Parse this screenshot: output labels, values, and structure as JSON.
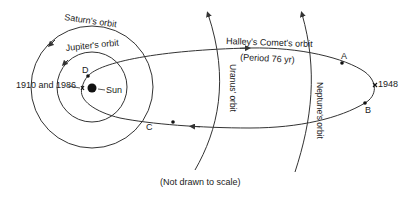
{
  "diagram": {
    "type": "orbital-diagram",
    "colors": {
      "line": "#333333",
      "text": "#222222",
      "background": "#ffffff"
    },
    "labels": {
      "saturn_orbit": "Saturn's orbit",
      "jupiter_orbit": "Jupiter's orbit",
      "uranus_orbit": "Uranus' orbit",
      "neptune_orbit": "Neptune's orbit",
      "comet_orbit": "Halley's Comet's orbit",
      "comet_period": "(Period 76 yr)",
      "sun": "Sun",
      "perihelion_years": "1910 and 1986",
      "aphelion_year": "1948",
      "point_a": "A",
      "point_b": "B",
      "point_c": "C",
      "point_d": "D",
      "scale_note": "(Not drawn to scale)"
    }
  }
}
